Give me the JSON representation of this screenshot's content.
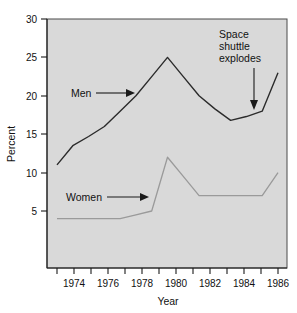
{
  "chart_data": {
    "type": "line",
    "title": "",
    "xlabel": "Year",
    "ylabel": "Percent",
    "xlim": [
      1973,
      1987
    ],
    "ylim": [
      0,
      30
    ],
    "yticks": [
      5,
      10,
      15,
      20,
      25,
      30
    ],
    "ytick_labels": [
      "5",
      "10",
      "15",
      "20",
      "25",
      "30"
    ],
    "xticks": [
      1973,
      1974,
      1975,
      1976,
      1977,
      1978,
      1979,
      1980,
      1981,
      1982,
      1983,
      1984,
      1985,
      1986,
      1987
    ],
    "xtick_labels": [
      "",
      "1974",
      "",
      "1976",
      "",
      "1978",
      "",
      "1980",
      "",
      "1982",
      "",
      "1984",
      "",
      "1986",
      ""
    ],
    "x": [
      1973,
      1974,
      1975,
      1976,
      1977,
      1978,
      1979,
      1980,
      1981,
      1982,
      1983,
      1984,
      1985,
      1986,
      1987
    ],
    "grid": false,
    "legend_position": "inline-labels",
    "series": [
      {
        "name": "Men",
        "color": "#2b2b2b",
        "values": [
          11.0,
          13.5,
          14.7,
          16.0,
          18.0,
          20.0,
          22.5,
          25.0,
          22.5,
          20.0,
          18.3,
          16.8,
          17.3,
          18.0,
          23.0
        ]
      },
      {
        "name": "Women",
        "color": "#9a9a9a",
        "values": [
          4.0,
          4.0,
          4.0,
          4.0,
          4.0,
          4.5,
          5.0,
          12.0,
          9.5,
          7.0,
          7.0,
          7.0,
          7.0,
          7.0,
          10.0
        ]
      }
    ],
    "annotations": [
      {
        "id": "space-shuttle",
        "lines": [
          "Space",
          "shuttle",
          "explodes"
        ],
        "points_to_year": 1986,
        "points_to_value": 18.0
      },
      {
        "id": "men-label",
        "lines": [
          "Men"
        ],
        "points_to_year": 1977,
        "points_to_value": 18.0
      },
      {
        "id": "women-label",
        "lines": [
          "Women"
        ],
        "points_to_year": 1979,
        "points_to_value": 5.0
      }
    ]
  },
  "labels": {
    "y_axis_title": "Percent",
    "x_axis_title": "Year",
    "men": "Men",
    "women": "Women",
    "annotation_line1": "Space",
    "annotation_line2": "shuttle",
    "annotation_line3": "explodes",
    "ytick_30": "30",
    "ytick_25": "25",
    "ytick_20": "20",
    "ytick_15": "15",
    "ytick_10": "10",
    "ytick_5": "5",
    "xtick_1974": "1974",
    "xtick_1976": "1976",
    "xtick_1978": "1978",
    "xtick_1980": "1980",
    "xtick_1982": "1982",
    "xtick_1984": "1984",
    "xtick_1986": "1986"
  },
  "colors": {
    "plot_background": "#d9d9d9",
    "page_background": "#ffffff",
    "men_line": "#2b2b2b",
    "women_line": "#9a9a9a",
    "axis": "#1a1a1a"
  }
}
